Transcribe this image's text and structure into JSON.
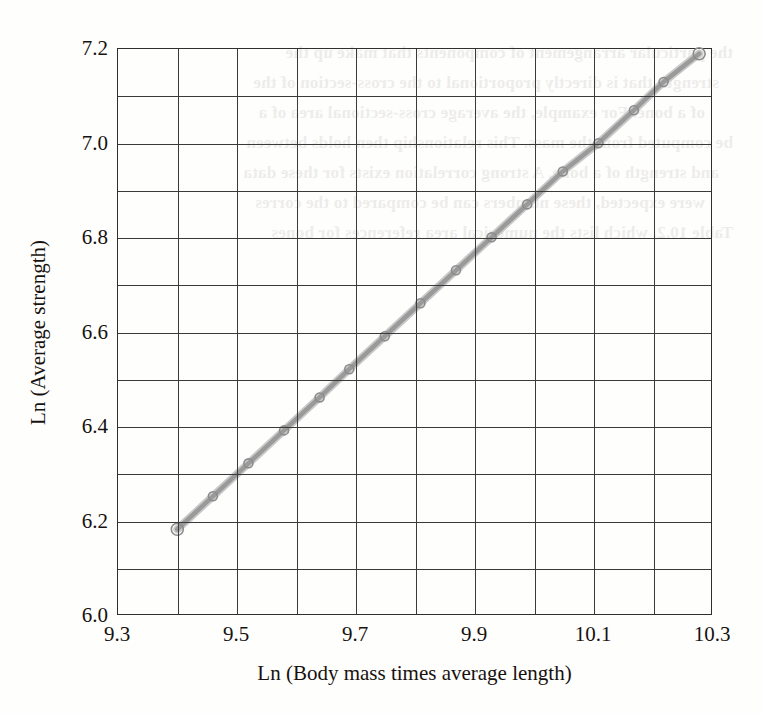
{
  "figure": {
    "background_color": "#fefefd",
    "axis_color": "#2f2f2f",
    "grid_color": "#3a3a3a",
    "series_color": "#9a9a9a",
    "marker_edge_color": "#8c8c8c",
    "text_color": "#17120f"
  },
  "axes": {
    "x_title": "Ln (Body mass times average length)",
    "y_title": "Ln (Average strength)",
    "x_tick_labels": [
      "9.3",
      "9.5",
      "9.7",
      "9.9",
      "10.1",
      "10.3"
    ],
    "x_tick_values": [
      9.3,
      9.5,
      9.7,
      9.9,
      10.1,
      10.3
    ],
    "y_tick_labels": [
      "6.0",
      "6.2",
      "6.4",
      "6.6",
      "6.8",
      "7.0",
      "7.2"
    ],
    "y_tick_values": [
      6.0,
      6.2,
      6.4,
      6.6,
      6.8,
      7.0,
      7.2
    ],
    "x_minor_step": 0.1,
    "y_minor_step": 0.1
  },
  "bleed_text": {
    "lines": [
      "the particular arrangement of components that make up the",
      "strength that is directly proportional to the cross-section of the",
      "of a bone. For example, the average cross-sectional area of a",
      "be computed from the mass. This relationship then holds between",
      "and strength of a bone. A strong correlation exists for these data",
      "were expected, these numbers can be compared to the corres",
      "Table 10.2, which lists the numerical area references for bones"
    ]
  },
  "chart_data": {
    "type": "line",
    "title": "",
    "xlabel": "Ln (Body mass times average length)",
    "ylabel": "Ln (Average strength)",
    "xlim": [
      9.3,
      10.3
    ],
    "ylim": [
      6.0,
      7.2
    ],
    "grid": true,
    "legend": "none",
    "marker": "open-circle",
    "series": [
      {
        "name": "Ln (Average strength) vs Ln (Body mass times average length)",
        "x": [
          9.4,
          9.46,
          9.52,
          9.58,
          9.64,
          9.69,
          9.75,
          9.81,
          9.87,
          9.93,
          9.99,
          10.05,
          10.11,
          10.17,
          10.22,
          10.28
        ],
        "y": [
          6.18,
          6.25,
          6.32,
          6.39,
          6.46,
          6.52,
          6.59,
          6.66,
          6.73,
          6.8,
          6.87,
          6.94,
          7.0,
          7.07,
          7.13,
          7.19
        ]
      }
    ],
    "annotations": []
  }
}
